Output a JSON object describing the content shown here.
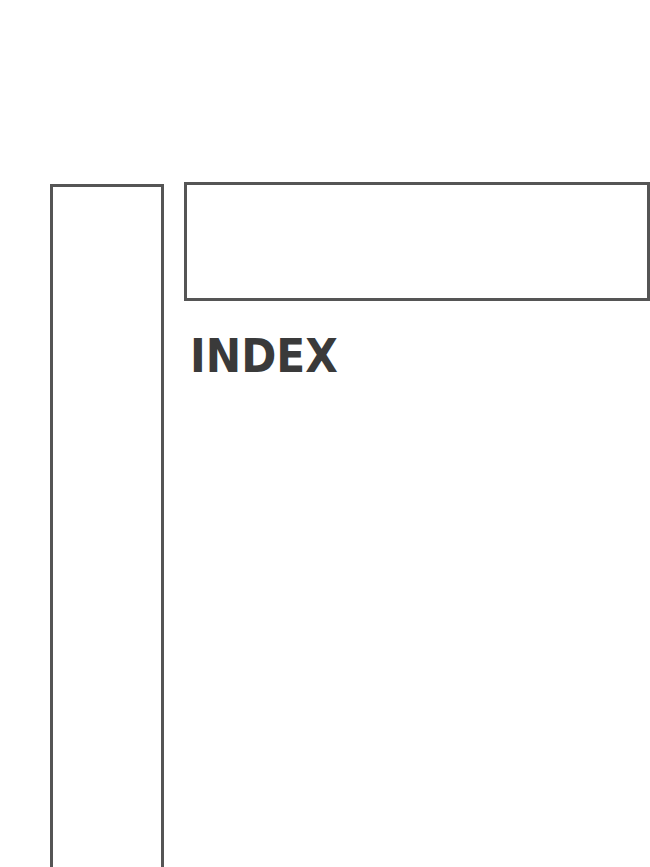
{
  "page": {
    "title": "INDEX"
  },
  "colors": {
    "frame_stroke": "#555555",
    "title_text": "#3a3a3a",
    "background": "#ffffff"
  }
}
